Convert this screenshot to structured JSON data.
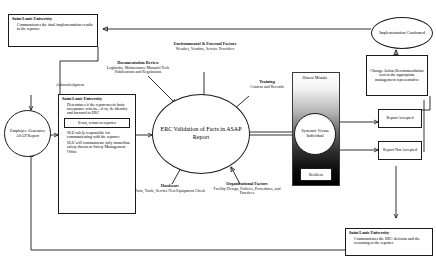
{
  "diagram": {
    "colors": {
      "stroke": "#1a1a1a",
      "background": "#ffffff",
      "severity_dark": "#000000",
      "severity_light": "#ffffff"
    }
  },
  "nodes": {
    "slu_final": {
      "header": "Saint Louis University",
      "bullets": [
        "Communicates the final implementation results to the reporter"
      ]
    },
    "employee_generates": {
      "label": "Employee Generates ASAP Report"
    },
    "slu_determines": {
      "header": "Saint Louis University",
      "bullets": [
        "Determines if the report meets basic acceptance criteria—if so, de-identify and forward to ERC"
      ],
      "inner_note": "If not, return to reporter",
      "bullets2": [
        "SLU solely responsible for communicating with the reporter",
        "SLU will communicate only immediate safety threats to Safety Management Office"
      ]
    },
    "erc": {
      "label": "ERC Validation of Facts in ASAP Report"
    },
    "honest_mistake": {
      "label": "Honest Mistake"
    },
    "systemic_individual": {
      "label": "Systemic Versus Individual"
    },
    "reckless": {
      "label": "Reckless"
    },
    "implementation_confirmed": {
      "label": "Implementation Confirmed"
    },
    "change_action": {
      "label": "Change Action Recommendation sent to the appropriate management representative"
    },
    "report_accepted": {
      "label": "Report Accepted"
    },
    "report_not_accepted": {
      "label": "Report Not Accepted"
    },
    "slu_erc_decision": {
      "header": "Saint Louis University",
      "bullets": [
        "Communicates the ERC decision and the reasoning to the reporter"
      ]
    }
  },
  "labels": {
    "acknowledgment": "Acknowledgment",
    "documentation_review": {
      "title": "Documentation Review",
      "detail": "Logbooks, Maintenance Manuals/Tech Publications and Regulations"
    },
    "environmental_external": {
      "title": "Environmental & External Factors",
      "detail": "Weather, Vendors, Service Providers"
    },
    "training": {
      "title": "Training",
      "detail": "Content and Records"
    },
    "hardware": {
      "title": "Hardware",
      "detail": "Parts, Tools, Service/Test Equipment Check"
    },
    "organizational_factors": {
      "title": "Organizational Factors",
      "detail": "Facility Design, Policies, Procedures, and Practices"
    }
  }
}
